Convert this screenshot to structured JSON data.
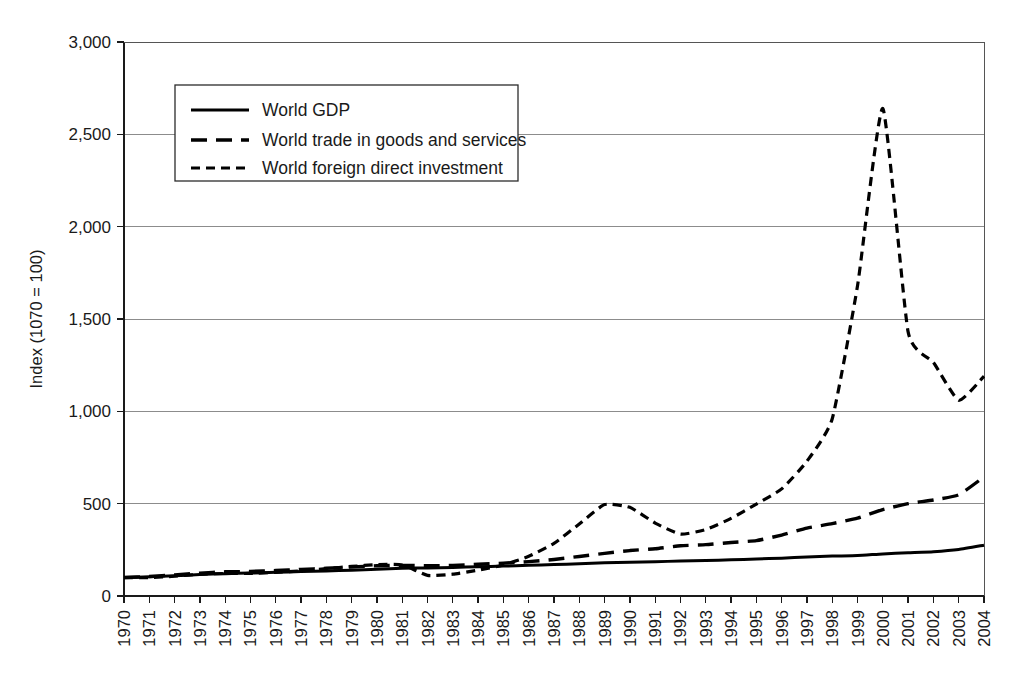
{
  "chart_data": {
    "type": "line",
    "title": "",
    "subtitle": "",
    "xlabel": "",
    "ylabel": "Index (1070 = 100)",
    "grid": true,
    "legend_position": "upper-left-inside",
    "xlim": [
      1970,
      2004
    ],
    "ylim": [
      0,
      3000
    ],
    "ytick_labels": [
      "0",
      "500",
      "1,000",
      "1,500",
      "2,000",
      "2,500",
      "3,000"
    ],
    "ytick_values": [
      0,
      500,
      1000,
      1500,
      2000,
      2500,
      3000
    ],
    "categories": [
      "1970",
      "1971",
      "1972",
      "1973",
      "1974",
      "1975",
      "1976",
      "1977",
      "1978",
      "1979",
      "1980",
      "1981",
      "1982",
      "1983",
      "1984",
      "1985",
      "1986",
      "1987",
      "1988",
      "1989",
      "1990",
      "1991",
      "1992",
      "1993",
      "1994",
      "1995",
      "1996",
      "1997",
      "1998",
      "1999",
      "2000",
      "2001",
      "2002",
      "2003",
      "2004"
    ],
    "series": [
      {
        "name": "World GDP",
        "style": "solid",
        "values": [
          100,
          104,
          110,
          116,
          121,
          124,
          128,
          132,
          136,
          140,
          145,
          150,
          152,
          155,
          158,
          162,
          166,
          170,
          175,
          180,
          183,
          186,
          189,
          192,
          196,
          200,
          205,
          211,
          216,
          219,
          228,
          234,
          240,
          252,
          275
        ]
      },
      {
        "name": "World trade in goods and services",
        "style": "long-dash",
        "values": [
          100,
          106,
          114,
          124,
          131,
          133,
          138,
          144,
          150,
          157,
          164,
          166,
          164,
          166,
          172,
          178,
          186,
          198,
          214,
          231,
          246,
          256,
          272,
          278,
          290,
          300,
          330,
          368,
          392,
          422,
          468,
          500,
          520,
          548,
          645
        ]
      },
      {
        "name": "World foreign direct investment",
        "style": "short-dash",
        "values": [
          100,
          100,
          107,
          118,
          122,
          122,
          128,
          136,
          148,
          160,
          170,
          168,
          112,
          118,
          140,
          168,
          215,
          285,
          390,
          495,
          480,
          395,
          335,
          360,
          420,
          498,
          580,
          730,
          960,
          1680,
          2640,
          1430,
          1265,
          1060,
          1190
        ]
      }
    ],
    "annotations": []
  }
}
